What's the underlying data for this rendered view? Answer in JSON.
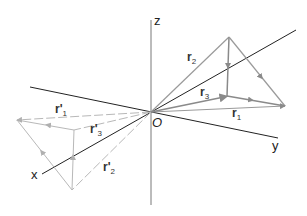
{
  "diagram": {
    "axes": {
      "z_label": "z",
      "y_label": "y",
      "x_label": "x",
      "origin_label": "O"
    },
    "vectors": {
      "r1": {
        "base": "r",
        "sub": "1"
      },
      "r2": {
        "base": "r",
        "sub": "2"
      },
      "r3": {
        "base": "r",
        "sub": "3"
      },
      "rp1": {
        "base": "r'",
        "sub": "1"
      },
      "rp2": {
        "base": "r'",
        "sub": "2"
      },
      "rp3": {
        "base": "r'",
        "sub": "3"
      }
    },
    "colors": {
      "axis": "#2a2a2a",
      "vector": "#9a9a9a",
      "reflected_vector": "#b8b8b8",
      "background": "#ffffff"
    }
  }
}
